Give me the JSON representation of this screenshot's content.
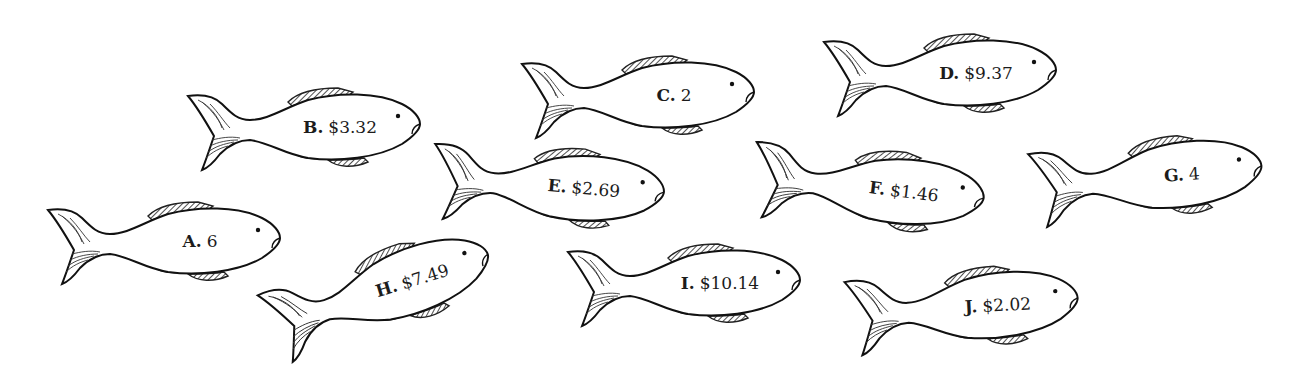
{
  "fish": [
    {
      "letter": "A.",
      "value": "6",
      "x": 48,
      "y": 196,
      "rot": 0
    },
    {
      "letter": "B.",
      "value": "$3.32",
      "x": 188,
      "y": 82,
      "rot": 0
    },
    {
      "letter": "C.",
      "value": "2",
      "x": 522,
      "y": 50,
      "rot": 0
    },
    {
      "letter": "D.",
      "value": "$9.37",
      "x": 824,
      "y": 28,
      "rot": 0
    },
    {
      "letter": "E.",
      "value": "$2.69",
      "x": 432,
      "y": 140,
      "rot": 5
    },
    {
      "letter": "F.",
      "value": "$1.46",
      "x": 752,
      "y": 142,
      "rot": 7
    },
    {
      "letter": "G.",
      "value": "4",
      "x": 1030,
      "y": 132,
      "rot": -4
    },
    {
      "letter": "H.",
      "value": "$7.49",
      "x": 262,
      "y": 246,
      "rot": -17
    },
    {
      "letter": "I.",
      "value": "$10.14",
      "x": 568,
      "y": 238,
      "rot": 0
    },
    {
      "letter": "J.",
      "value": "$2.02",
      "x": 846,
      "y": 262,
      "rot": -3
    }
  ]
}
